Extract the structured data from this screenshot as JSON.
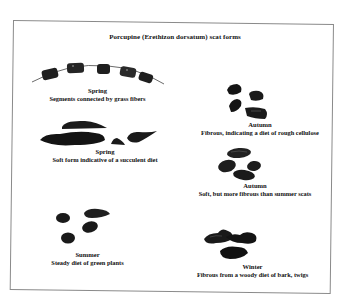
{
  "title": "Porcupine (Erethizon dorsatum) scat forms",
  "panels": [
    {
      "id": "spring-1",
      "season": "Spring",
      "description": "Segments connected by grass fibers"
    },
    {
      "id": "spring-2",
      "season": "Spring",
      "description": "Soft form indicative of a succulent diet"
    },
    {
      "id": "summer",
      "season": "Summer",
      "description": "Steady diet of green plants"
    },
    {
      "id": "autumn-1",
      "season": "Autumn",
      "description": "Fibrous, indicating a diet of rough cellulose"
    },
    {
      "id": "autumn-2",
      "season": "Autumn",
      "description": "Soft, but more fibrous than summer scats"
    },
    {
      "id": "winter",
      "season": "Winter",
      "description": "Fibrous from a woody diet of bark, twigs"
    }
  ],
  "colors": {
    "frame": "#8a8a8a",
    "scat": "#1a1a1a",
    "fiber": "#6b6b6b"
  }
}
